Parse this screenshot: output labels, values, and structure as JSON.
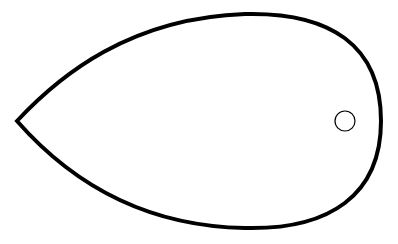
{
  "diagram": {
    "shape": "teardrop-outline",
    "stroke_color": "#000000",
    "fill_color": "#ffffff",
    "background": "#ffffff",
    "outline_stroke_width": 4,
    "marker": {
      "shape": "circle",
      "cx": 345,
      "cy": 121,
      "r": 10,
      "stroke_width": 1
    }
  }
}
